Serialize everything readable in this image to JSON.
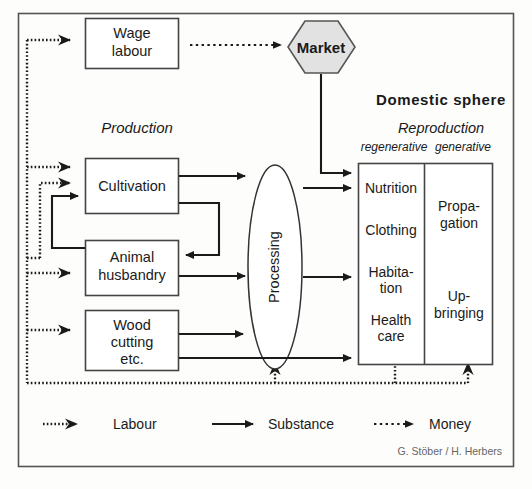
{
  "figure": {
    "frame": {
      "border_color": "#555555",
      "background": "#fdfdfc"
    },
    "attribution": "G. Stöber / H. Herbers"
  },
  "nodes": {
    "wage_labour": {
      "label_line1": "Wage",
      "label_line2": "labour",
      "shape": "rectangle"
    },
    "market": {
      "label": "Market",
      "shape": "hexagon",
      "fill": "#e2e2e2"
    },
    "cultivation": {
      "label": "Cultivation",
      "shape": "rectangle"
    },
    "animal_husbandry": {
      "label_line1": "Animal",
      "label_line2": "husbandry",
      "shape": "rectangle"
    },
    "wood_cutting": {
      "label_line1": "Wood",
      "label_line2": "cutting",
      "label_line3": "etc.",
      "shape": "rectangle"
    },
    "processing": {
      "label": "Processing",
      "shape": "ellipse",
      "text_orientation": "vertical-bottom-up"
    }
  },
  "section_labels": {
    "production": "Production",
    "domestic_sphere": "Domestic sphere",
    "reproduction": "Reproduction",
    "regenerative": "regenerative",
    "generative": "generative"
  },
  "domestic_sphere": {
    "regenerative_items": [
      "Nutrition",
      "Clothing",
      "Habita-",
      "tion",
      "Health",
      "care"
    ],
    "regenerative_entries": [
      {
        "lines": [
          "Nutrition"
        ]
      },
      {
        "lines": [
          "Clothing"
        ]
      },
      {
        "lines": [
          "Habita-",
          "tion"
        ]
      },
      {
        "lines": [
          "Health",
          "care"
        ]
      }
    ],
    "generative_entries": [
      {
        "lines": [
          "Propa-",
          "gation"
        ]
      },
      {
        "lines": [
          "Up-",
          "bringing"
        ]
      }
    ]
  },
  "legend": {
    "items": [
      {
        "label": "Labour",
        "style": "dotted-thick",
        "icon": "arrow-right-icon"
      },
      {
        "label": "Substance",
        "style": "solid",
        "icon": "arrow-right-icon"
      },
      {
        "label": "Money",
        "style": "dotted-fine",
        "icon": "arrow-right-icon"
      }
    ]
  },
  "colors": {
    "line": "#1a1a1a",
    "box_stroke": "#444444",
    "market_fill": "#e2e2e2",
    "frame": "#555555",
    "text": "#1a1a1a",
    "attribution_text": "#666666"
  }
}
